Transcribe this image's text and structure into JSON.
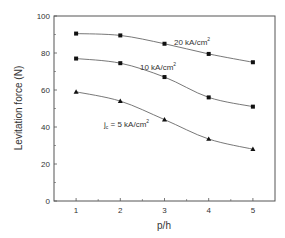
{
  "chart_data": {
    "type": "line",
    "title": "",
    "xlabel": "p/h",
    "ylabel": "Levitation force (N)",
    "x": [
      1,
      2,
      3,
      4,
      5
    ],
    "xlim": [
      0.5,
      5.5
    ],
    "ylim": [
      0,
      100
    ],
    "xticks": [
      1,
      2,
      3,
      4,
      5
    ],
    "yticks": [
      0,
      20,
      40,
      60,
      80,
      100
    ],
    "grid": false,
    "legend": "none (inline annotations)",
    "series": [
      {
        "name": "20 kA/cm²",
        "marker": "square",
        "values": [
          90.5,
          89.5,
          85,
          79.5,
          75
        ]
      },
      {
        "name": "10 kA/cm²",
        "marker": "square",
        "values": [
          77,
          74.5,
          67,
          56,
          51
        ]
      },
      {
        "name": "jc = 5 kA/cm²",
        "marker": "triangle",
        "values": [
          59,
          54,
          44,
          33.5,
          28
        ]
      }
    ],
    "annotations": [
      {
        "text": "20 kA/cm",
        "sup": "2",
        "near_series": 0
      },
      {
        "text": "10 kA/cm",
        "sup": "2",
        "near_series": 1
      },
      {
        "text": "j",
        "sub": "c",
        "rest": " = 5 kA/cm",
        "sup": "2",
        "near_series": 2
      }
    ]
  },
  "labels": {
    "xlabel": "p/h",
    "ylabel": "Levitation force (N)",
    "ann20": "20 kA/cm",
    "ann10": "10 kA/cm",
    "ann5_j": "j",
    "ann5_sub": "c",
    "ann5_rest": " = 5 kA/cm",
    "sup": "2"
  },
  "colors": {
    "axis": "#555555",
    "line": "#555555",
    "marker": "#111111",
    "text": "#333333"
  }
}
